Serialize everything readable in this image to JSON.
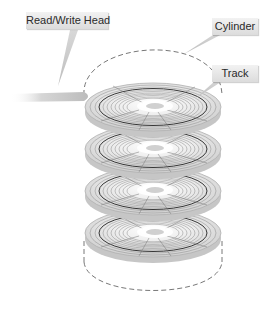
{
  "diagram": {
    "labels": {
      "read_write_head": "Read/Write Head",
      "cylinder": "Cylinder",
      "track": "Track"
    },
    "platter_count": 4,
    "colors": {
      "platter_fill": "#e6e6e6",
      "platter_edge": "#bdbdbd",
      "track_line": "#7a7a7a",
      "highlight_track": "#333333",
      "label_bg": "#e4e4e4",
      "dashed_cylinder": "#555555",
      "arm": "#c8c8c8"
    }
  }
}
